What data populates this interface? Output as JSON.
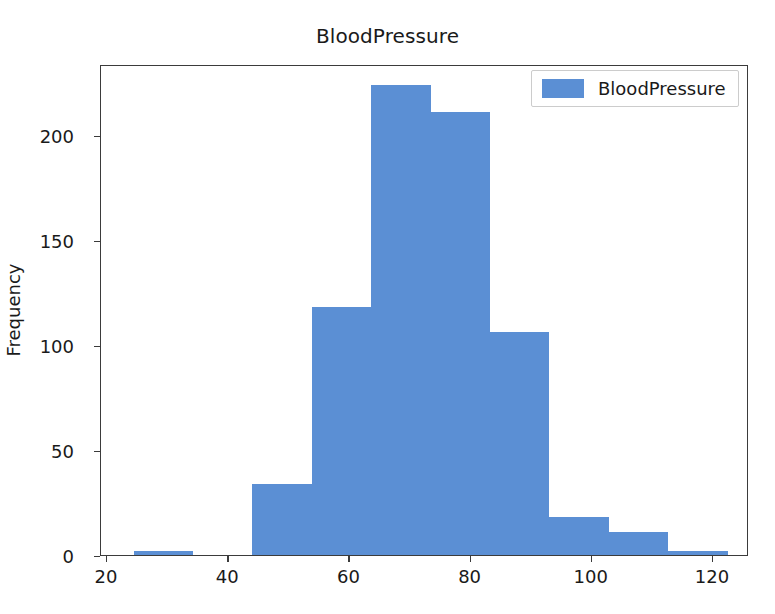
{
  "chart_data": {
    "type": "bar",
    "subtype": "histogram",
    "title": "BloodPressure",
    "xlabel": "",
    "ylabel": "Frequency",
    "xlim": [
      20,
      126
    ],
    "ylim": [
      0,
      233
    ],
    "grid": false,
    "legend_position": "upper right",
    "legend": [
      "BloodPressure"
    ],
    "bar_color": "#5b8fd4",
    "xticks": [
      20,
      40,
      60,
      80,
      100,
      120
    ],
    "xtick_labels": [
      "20",
      "40",
      "60",
      "80",
      "100",
      "120"
    ],
    "yticks": [
      0,
      50,
      100,
      150,
      200
    ],
    "ytick_labels": [
      "0",
      "50",
      "100",
      "150",
      "200"
    ],
    "bin_edges": [
      24.4,
      34.2,
      44.0,
      53.8,
      63.6,
      73.4,
      83.2,
      93.0,
      102.8,
      112.6,
      122.4
    ],
    "categories": [
      "24.4-34.2",
      "34.2-44.0",
      "44.0-53.8",
      "53.8-63.6",
      "63.6-73.4",
      "73.4-83.2",
      "83.2-93.0",
      "93.0-102.8",
      "102.8-112.6",
      "112.6-122.4"
    ],
    "values": [
      2,
      0,
      34,
      118,
      224,
      211,
      106,
      18,
      11,
      2
    ],
    "series": [
      {
        "name": "BloodPressure",
        "values": [
          2,
          0,
          34,
          118,
          224,
          211,
          106,
          18,
          11,
          2
        ]
      }
    ]
  },
  "figure": {
    "background": "#ffffff",
    "axes_edge_color": "#3b3b3b",
    "text_color": "#1a1a1a"
  }
}
